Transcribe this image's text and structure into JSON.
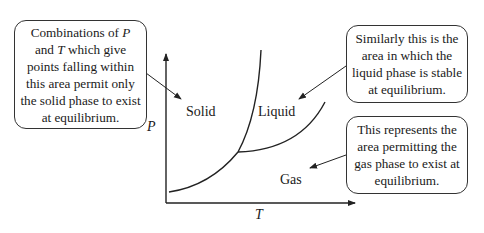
{
  "diagram": {
    "type": "phase diagram",
    "axes": {
      "x_label": "T",
      "y_label": "P"
    },
    "regions": {
      "solid": "Solid",
      "liquid": "Liquid",
      "gas": "Gas"
    },
    "callouts": {
      "solid": {
        "pre": "Combinations of ",
        "var1": "P",
        "mid1": " and ",
        "var2": "T",
        "post": " which give points falling within this area permit only the solid phase to exist at equilibrium."
      },
      "liquid": "Similarly this is the area in which the liquid phase is stable at equilibrium.",
      "gas": "This represents the area permitting the gas phase to exist at equilibrium."
    },
    "colors": {
      "line": "#222222",
      "background": "#ffffff"
    }
  }
}
